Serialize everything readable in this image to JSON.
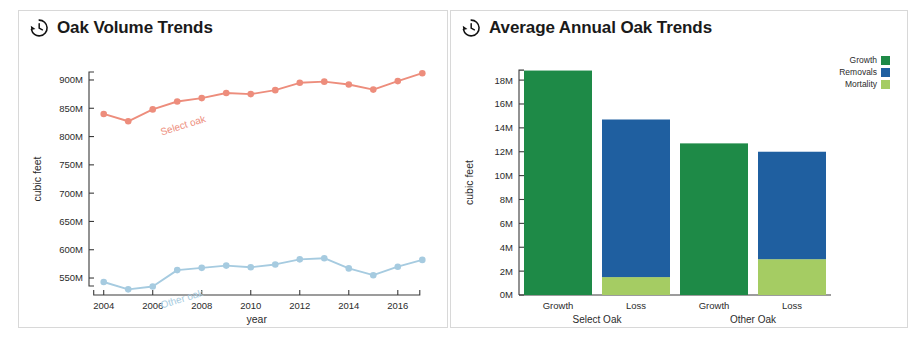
{
  "panels": {
    "left": {
      "icon": "history-clock-icon",
      "title": "Oak Volume Trends"
    },
    "right": {
      "icon": "history-clock-icon",
      "title": "Average Annual Oak Trends"
    }
  },
  "colors": {
    "select_oak": "#ED8D7C",
    "other_oak": "#A6CBE0",
    "growth": "#1E8A47",
    "removals": "#1F5FA0",
    "mortality": "#A5CC63",
    "axis": "#3a3a3a",
    "panel_border": "#d8d8d8",
    "text": "#2b2b2b"
  },
  "chart_data": [
    {
      "type": "line",
      "title": "Oak Volume Trends",
      "xlabel": "year",
      "ylabel": "cubic feet",
      "xlim": [
        2003.4,
        2017.6
      ],
      "ylim": [
        520000000,
        930000000
      ],
      "xticks": [
        2004,
        2006,
        2008,
        2010,
        2012,
        2014,
        2016
      ],
      "xtick_labels": [
        "2004",
        "2006",
        "2008",
        "2010",
        "2012",
        "2014",
        "2016"
      ],
      "yticks": [
        550000000,
        600000000,
        650000000,
        700000000,
        750000000,
        800000000,
        850000000,
        900000000
      ],
      "ytick_labels": [
        "550M",
        "600M",
        "650M",
        "700M",
        "750M",
        "800M",
        "850M",
        "900M"
      ],
      "grid": false,
      "legend": "inline-annotations",
      "x": [
        2004,
        2005,
        2006,
        2007,
        2008,
        2009,
        2010,
        2011,
        2012,
        2013,
        2014,
        2015,
        2016,
        2017
      ],
      "series": [
        {
          "name": "Select oak",
          "color": "#ED8D7C",
          "annotation": "Select oak",
          "values": [
            840000000,
            827000000,
            848000000,
            862000000,
            868000000,
            877000000,
            875000000,
            882000000,
            895000000,
            897000000,
            892000000,
            883000000,
            898000000,
            912000000
          ]
        },
        {
          "name": "Other oak",
          "color": "#A6CBE0",
          "annotation": "Other oak",
          "values": [
            543000000,
            530000000,
            535000000,
            564000000,
            568000000,
            572000000,
            569000000,
            574000000,
            583000000,
            585000000,
            567000000,
            555000000,
            570000000,
            582000000
          ]
        }
      ]
    },
    {
      "type": "bar",
      "subtype": "stacked",
      "title": "Average Annual Oak Trends",
      "xlabel": "",
      "ylabel": "cubic feet",
      "ylim": [
        0,
        19600000
      ],
      "yticks": [
        0,
        2000000,
        4000000,
        6000000,
        8000000,
        10000000,
        12000000,
        14000000,
        16000000,
        18000000
      ],
      "ytick_labels": [
        "0M",
        "2M",
        "4M",
        "6M",
        "8M",
        "10M",
        "12M",
        "14M",
        "16M",
        "18M"
      ],
      "grid": false,
      "legend_position": "top-right",
      "categories": [
        "Growth",
        "Loss",
        "Growth",
        "Loss"
      ],
      "groups": [
        {
          "label": "Select Oak",
          "categories": [
            "Growth",
            "Loss"
          ]
        },
        {
          "label": "Other Oak",
          "categories": [
            "Growth",
            "Loss"
          ]
        }
      ],
      "series": [
        {
          "name": "Growth",
          "color": "#1E8A47",
          "values": [
            18800000,
            0,
            12700000,
            0
          ]
        },
        {
          "name": "Removals",
          "color": "#1F5FA0",
          "values": [
            0,
            13200000,
            0,
            9000000
          ]
        },
        {
          "name": "Mortality",
          "color": "#A5CC63",
          "values": [
            0,
            1500000,
            0,
            3000000
          ]
        }
      ],
      "bars": [
        {
          "group": "Select Oak",
          "category": "Growth",
          "total": 18800000,
          "segments": [
            {
              "name": "Growth",
              "value": 18800000
            }
          ]
        },
        {
          "group": "Select Oak",
          "category": "Loss",
          "total": 14700000,
          "segments": [
            {
              "name": "Mortality",
              "value": 1500000
            },
            {
              "name": "Removals",
              "value": 13200000
            }
          ]
        },
        {
          "group": "Other Oak",
          "category": "Growth",
          "total": 12700000,
          "segments": [
            {
              "name": "Growth",
              "value": 12700000
            }
          ]
        },
        {
          "group": "Other Oak",
          "category": "Loss",
          "total": 12000000,
          "segments": [
            {
              "name": "Mortality",
              "value": 3000000
            },
            {
              "name": "Removals",
              "value": 9000000
            }
          ]
        }
      ],
      "legend": [
        {
          "label": "Growth",
          "color": "#1E8A47"
        },
        {
          "label": "Removals",
          "color": "#1F5FA0"
        },
        {
          "label": "Mortality",
          "color": "#A5CC63"
        }
      ]
    }
  ]
}
